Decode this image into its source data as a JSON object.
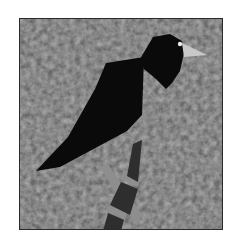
{
  "image": {
    "subject": "bird quilt block",
    "colors": {
      "background": "#ffffff",
      "fabric": "#6e6e6e",
      "fabric_light": "#8a8a8a",
      "bird_body": "#0a0a0a",
      "beak": "#c8c8c8",
      "eye": "#e8e8e8",
      "branch_dark": "#2e2e2e",
      "branch_light": "#8c8c8c",
      "border": "#2a2a2a"
    }
  }
}
